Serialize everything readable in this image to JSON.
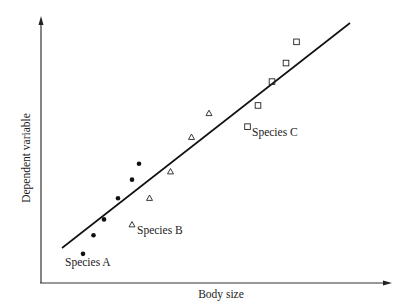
{
  "chart_data": {
    "type": "scatter",
    "title": "",
    "xlabel": "Body size",
    "ylabel": "Dependent variable",
    "grid": false,
    "legend": "none (inline point labels)",
    "axes_ticks": "none",
    "xlim": [
      0,
      100
    ],
    "ylim": [
      0,
      100
    ],
    "series": [
      {
        "name": "Species A",
        "marker": "filled-circle",
        "points": [
          [
            12,
            11
          ],
          [
            15,
            18
          ],
          [
            18,
            24
          ],
          [
            22,
            32
          ],
          [
            26,
            39
          ],
          [
            28,
            45
          ]
        ]
      },
      {
        "name": "Species B",
        "marker": "open-triangle",
        "points": [
          [
            26,
            22
          ],
          [
            31,
            32
          ],
          [
            37,
            42
          ],
          [
            43,
            55
          ],
          [
            48,
            64
          ]
        ]
      },
      {
        "name": "Species C",
        "marker": "open-square",
        "points": [
          [
            59,
            59
          ],
          [
            62,
            67
          ],
          [
            66,
            76
          ],
          [
            70,
            83
          ],
          [
            73,
            91
          ]
        ]
      }
    ],
    "fit_line": {
      "type": "linear",
      "from": [
        6,
        13
      ],
      "to": [
        88,
        97
      ]
    },
    "annotations": [
      {
        "text": "Species A",
        "near_series": "Species A"
      },
      {
        "text": "Species B",
        "near_series": "Species B"
      },
      {
        "text": "Species C",
        "near_series": "Species C"
      }
    ]
  },
  "labels": {
    "xaxis": "Body size",
    "yaxis": "Dependent variable",
    "species_a": "Species A",
    "species_b": "Species B",
    "species_c": "Species C"
  }
}
